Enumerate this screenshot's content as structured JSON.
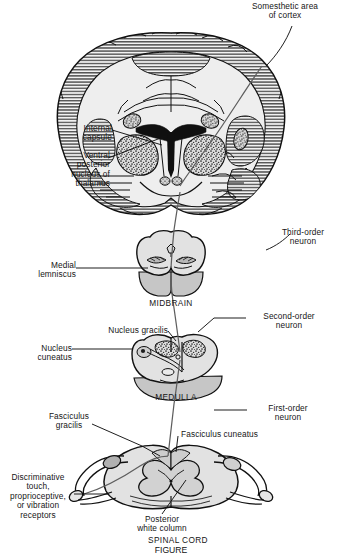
{
  "figure": {
    "caption": "FIGURE",
    "background_color": "#ffffff",
    "ink_color": "#161616",
    "tissue_fill": "#e4e4e4",
    "tissue_fill_light": "#ededed",
    "tissue_fill_dark": "#c9c9c9",
    "nucleus_fill": "#b4b4b4",
    "ventricle_fill": "#111111",
    "pathway_color": "#5a5a5a"
  },
  "labels": {
    "somesthetic_cortex": "Somesthetic area\nof cortex",
    "internal_capsule": "Internal\ncapsule",
    "ventral_posterior_nucleus": "Ventral\nposterior\nnucleus of\nthalamus",
    "third_order_neuron": "Third-order\nneuron",
    "medial_lemniscus": "Medial\nlemniscus",
    "midbrain": "MIDBRAIN",
    "second_order_neuron": "Second-order\nneuron",
    "nucleus_gracilis": "Nucleus gracilis",
    "nucleus_cuneatus": "Nucleus\ncuneatus",
    "medulla": "MEDULLA",
    "first_order_neuron": "First-order\nneuron",
    "fasciculus_gracilis": "Fasciculus\ngracilis",
    "fasciculus_cuneatus": "Fasciculus cuneatus",
    "receptors": "Discriminative touch,\nproprioceptive,\nor vibration\nreceptors",
    "posterior_white_column": "Posterior\nwhite column",
    "spinal_cord": "SPINAL CORD"
  },
  "sections": [
    {
      "name": "cerebrum",
      "label": "Somesthetic area of cortex",
      "level": "Coronal section of cerebrum"
    },
    {
      "name": "midbrain",
      "label": "MIDBRAIN",
      "level": "Midbrain cross section"
    },
    {
      "name": "medulla",
      "label": "MEDULLA",
      "level": "Medulla cross section"
    },
    {
      "name": "spinal-cord",
      "label": "SPINAL CORD",
      "level": "Spinal cord cross section"
    }
  ],
  "neurons": [
    {
      "order": "First-order neuron",
      "from": "Receptors",
      "to": "Nucleus gracilis / Nucleus cuneatus"
    },
    {
      "order": "Second-order neuron",
      "from": "Nucleus gracilis / cuneatus",
      "to": "Ventral posterior nucleus of thalamus"
    },
    {
      "order": "Third-order neuron",
      "from": "Thalamus",
      "to": "Somesthetic area of cortex"
    }
  ]
}
